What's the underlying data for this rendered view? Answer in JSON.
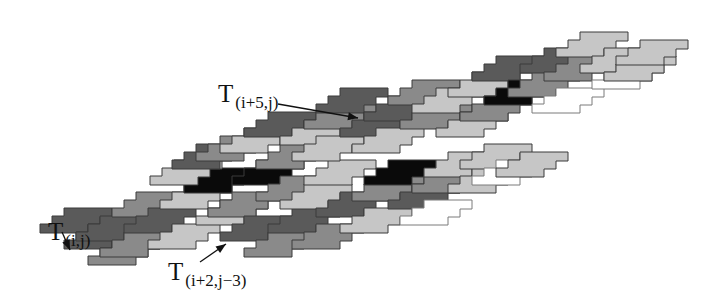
{
  "diagram": {
    "type": "tiling",
    "colors": {
      "dark": "#5a5a5a",
      "medium": "#8a8a8a",
      "light": "#c6c6c6",
      "black": "#0a0a0a",
      "white": "#ffffff",
      "stroke": "#3a3a3a",
      "outline": "#7a7a7a"
    },
    "labels": [
      {
        "id": "t-i-j",
        "main": "T",
        "sub": "(i,j)",
        "x": 48,
        "y": 218
      },
      {
        "id": "t-i5-j",
        "main": "T",
        "sub": "(i+5,j)",
        "x": 218,
        "y": 80
      },
      {
        "id": "t-i2-j3",
        "main": "T",
        "sub": "(i+2,j−3)",
        "x": 168,
        "y": 258
      }
    ],
    "arrows": [
      {
        "id": "arrow-t-i-j",
        "x1": 62,
        "y1": 232,
        "x2": 70,
        "y2": 250
      },
      {
        "id": "arrow-t-i5-j",
        "x1": 278,
        "y1": 104,
        "x2": 358,
        "y2": 118
      },
      {
        "id": "arrow-t-i2-j3",
        "x1": 200,
        "y1": 262,
        "x2": 226,
        "y2": 244
      }
    ]
  }
}
